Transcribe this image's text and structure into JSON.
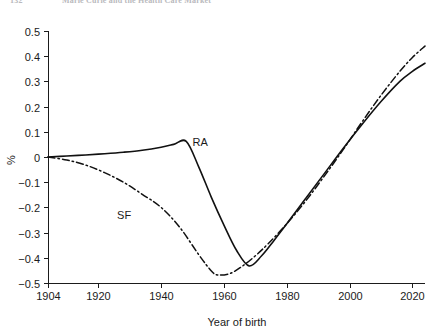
{
  "page_header": {
    "folio": "132",
    "running_head": "Marie Curie and the Health Care Market"
  },
  "chart_data": {
    "type": "line",
    "title": "",
    "subtitle": "",
    "xlabel": "Year of birth",
    "ylabel": "%",
    "xlim": [
      1904,
      2024
    ],
    "ylim": [
      -0.5,
      0.5
    ],
    "grid": false,
    "legend_position": "inline-annotation",
    "xticks": [
      1904,
      1920,
      1940,
      1960,
      1980,
      2000,
      2020
    ],
    "xtick_labels": [
      "1904",
      "1920",
      "1940",
      "1960",
      "1980",
      "2000",
      "2020"
    ],
    "yticks": [
      -0.5,
      -0.4,
      -0.3,
      -0.2,
      -0.1,
      0,
      0.1,
      0.2,
      0.3,
      0.4,
      0.5
    ],
    "ytick_labels": [
      "−0.5",
      "−0.4",
      "−0.3",
      "−0.2",
      "−0.1",
      "0",
      "0.1",
      "0.2",
      "0.3",
      "0.4",
      "0.5"
    ],
    "series": [
      {
        "name": "RA",
        "label": "RA",
        "style": "solid",
        "color": "#111111",
        "label_x": 1950,
        "label_y": 0.045,
        "x": [
          1904,
          1910,
          1916,
          1922,
          1928,
          1934,
          1940,
          1944,
          1948,
          1952,
          1956,
          1960,
          1964,
          1968,
          1972,
          1976,
          1980,
          1986,
          1992,
          1998,
          2004,
          2010,
          2016,
          2020,
          2024
        ],
        "y": [
          0.0,
          0.004,
          0.008,
          0.013,
          0.019,
          0.027,
          0.039,
          0.05,
          0.062,
          -0.04,
          -0.16,
          -0.27,
          -0.37,
          -0.432,
          -0.392,
          -0.33,
          -0.265,
          -0.165,
          -0.065,
          0.035,
          0.13,
          0.22,
          0.3,
          0.34,
          0.372
        ]
      },
      {
        "name": "SF",
        "label": "SF",
        "style": "dash-dot",
        "color": "#111111",
        "label_x": 1926,
        "label_y": -0.245,
        "x": [
          1904,
          1910,
          1916,
          1922,
          1928,
          1934,
          1940,
          1946,
          1952,
          1956,
          1958,
          1962,
          1966,
          1970,
          1974,
          1980,
          1986,
          1992,
          1998,
          2004,
          2010,
          2016,
          2020,
          2024
        ],
        "y": [
          0.0,
          -0.012,
          -0.032,
          -0.062,
          -0.1,
          -0.148,
          -0.2,
          -0.28,
          -0.388,
          -0.452,
          -0.468,
          -0.462,
          -0.432,
          -0.392,
          -0.345,
          -0.265,
          -0.175,
          -0.075,
          0.03,
          0.14,
          0.245,
          0.34,
          0.395,
          0.44
        ]
      }
    ]
  }
}
